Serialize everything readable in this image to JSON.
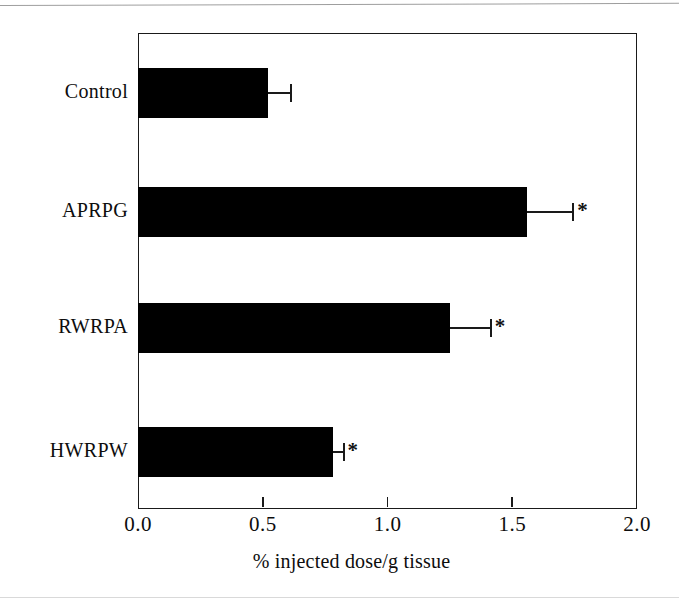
{
  "figure": {
    "background_color": "#ffffff",
    "bar_color": "#000000",
    "axis_color": "#1a1a1a"
  },
  "chart_data": {
    "type": "bar",
    "orientation": "horizontal",
    "title": "",
    "xlabel": "% injected dose/g tissue",
    "ylabel": "",
    "xlim": [
      0.0,
      2.0
    ],
    "xticks": [
      0.0,
      0.5,
      1.0,
      1.5,
      2.0
    ],
    "xtick_labels": [
      "0.0",
      "0.5",
      "1.0",
      "1.5",
      "2.0"
    ],
    "grid": false,
    "legend": false,
    "categories": [
      "Control",
      "APRPG",
      "RWRPA",
      "HWRPW"
    ],
    "values": [
      0.52,
      1.56,
      1.25,
      0.78
    ],
    "errors": [
      0.09,
      0.18,
      0.16,
      0.04
    ],
    "annotations": [
      "",
      "*",
      "*",
      "*"
    ],
    "significance_marker": "*",
    "series": [
      {
        "name": "% injected dose/g tissue",
        "values": [
          0.52,
          1.56,
          1.25,
          0.78
        ],
        "errors": [
          0.09,
          0.18,
          0.16,
          0.04
        ]
      }
    ],
    "bars": [
      {
        "category": "Control",
        "value": 0.52,
        "error": 0.09,
        "significant": false,
        "star": ""
      },
      {
        "category": "APRPG",
        "value": 1.56,
        "error": 0.18,
        "significant": true,
        "star": "*"
      },
      {
        "category": "RWRPA",
        "value": 1.25,
        "error": 0.16,
        "significant": true,
        "star": "*"
      },
      {
        "category": "HWRPW",
        "value": 0.78,
        "error": 0.04,
        "significant": true,
        "star": "*"
      }
    ]
  },
  "axis": {
    "x_title_part1": "% injected dose/g tissue"
  },
  "caption_bleed": "",
  "ticks": {
    "t0": "0.0",
    "t1": "0.5",
    "t2": "1.0",
    "t3": "1.5",
    "t4": "2.0"
  }
}
